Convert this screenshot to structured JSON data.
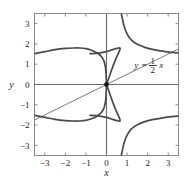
{
  "chart_data": {
    "type": "line",
    "title": "",
    "xlabel": "x",
    "ylabel": "y",
    "xlim": [
      -3.5,
      3.5
    ],
    "ylim": [
      -3.5,
      3.5
    ],
    "xticks": [
      -3,
      -2,
      -1,
      0,
      1,
      2,
      3
    ],
    "yticks": [
      -3,
      -2,
      -1,
      0,
      1,
      2,
      3
    ],
    "xtick_labels": [
      "−3",
      "−2",
      "−1",
      "0",
      "1",
      "2",
      "3"
    ],
    "ytick_labels": [
      "−3",
      "−2",
      "−1",
      "0",
      "1",
      "2",
      "3"
    ],
    "grid": false,
    "legend": "none",
    "annotations": [
      {
        "name": "line-equation-label",
        "text_y": "y",
        "text_eq": "=",
        "numerator": "1",
        "denominator": "2",
        "text_x": "x",
        "full_text": "y = 1/2 x",
        "x": 1.45,
        "y": 0.95
      }
    ],
    "markers": [
      {
        "name": "node-point",
        "x": 0,
        "y": 0,
        "style": "filled-dot",
        "color": "#1a1a1a"
      }
    ],
    "series": [
      {
        "name": "line-y-equals-half-x",
        "style": "thin-solid",
        "color": "#6b6b6b",
        "equation": "y = x/2",
        "points": [
          [
            -3.5,
            -1.75
          ],
          [
            3.5,
            1.75
          ]
        ]
      },
      {
        "name": "curve-upper-left-branch",
        "style": "thick-solid",
        "color": "#4a4a4a",
        "points": [
          [
            -3.5,
            1.52
          ],
          [
            -3.0,
            1.62
          ],
          [
            -2.5,
            1.72
          ],
          [
            -2.0,
            1.78
          ],
          [
            -1.6,
            1.8
          ],
          [
            -1.3,
            1.8
          ],
          [
            -1.0,
            1.77
          ],
          [
            -0.7,
            1.68
          ],
          [
            -0.45,
            1.55
          ],
          [
            -0.25,
            1.38
          ],
          [
            -0.12,
            1.15
          ],
          [
            -0.05,
            0.85
          ],
          [
            -0.02,
            0.5
          ],
          [
            0.0,
            0.0
          ]
        ]
      },
      {
        "name": "curve-loop-upper-right",
        "style": "thick-solid",
        "color": "#4a4a4a",
        "points": [
          [
            0.0,
            0.0
          ],
          [
            0.18,
            0.52
          ],
          [
            0.32,
            0.92
          ],
          [
            0.45,
            1.25
          ],
          [
            0.56,
            1.5
          ],
          [
            0.63,
            1.66
          ],
          [
            0.66,
            1.76
          ],
          [
            0.655,
            1.8
          ],
          [
            0.6,
            1.8
          ],
          [
            0.5,
            1.78
          ],
          [
            0.3,
            1.72
          ],
          [
            0.0,
            1.62
          ],
          [
            -0.4,
            1.55
          ],
          [
            -0.8,
            1.52
          ]
        ]
      },
      {
        "name": "curve-upper-right-asymptotic",
        "style": "thick-solid",
        "color": "#4a4a4a",
        "points": [
          [
            0.72,
            3.5
          ],
          [
            0.85,
            2.9
          ],
          [
            1.0,
            2.5
          ],
          [
            1.2,
            2.2
          ],
          [
            1.5,
            1.98
          ],
          [
            1.9,
            1.82
          ],
          [
            2.3,
            1.72
          ],
          [
            2.8,
            1.63
          ],
          [
            3.2,
            1.58
          ],
          [
            3.5,
            1.55
          ]
        ]
      },
      {
        "name": "curve-lower-left-branch",
        "style": "thick-solid",
        "color": "#4a4a4a",
        "points": [
          [
            -3.5,
            -1.52
          ],
          [
            -3.0,
            -1.62
          ],
          [
            -2.5,
            -1.72
          ],
          [
            -2.0,
            -1.78
          ],
          [
            -1.6,
            -1.8
          ],
          [
            -1.3,
            -1.8
          ],
          [
            -1.0,
            -1.77
          ],
          [
            -0.7,
            -1.68
          ],
          [
            -0.45,
            -1.55
          ],
          [
            -0.25,
            -1.38
          ],
          [
            -0.12,
            -1.15
          ],
          [
            -0.05,
            -0.85
          ],
          [
            -0.02,
            -0.5
          ],
          [
            0.0,
            0.0
          ]
        ]
      },
      {
        "name": "curve-loop-lower-right",
        "style": "thick-solid",
        "color": "#4a4a4a",
        "points": [
          [
            0.0,
            0.0
          ],
          [
            0.18,
            -0.52
          ],
          [
            0.32,
            -0.92
          ],
          [
            0.45,
            -1.25
          ],
          [
            0.56,
            -1.5
          ],
          [
            0.63,
            -1.66
          ],
          [
            0.66,
            -1.76
          ],
          [
            0.655,
            -1.8
          ],
          [
            0.6,
            -1.8
          ],
          [
            0.5,
            -1.78
          ],
          [
            0.3,
            -1.72
          ],
          [
            0.0,
            -1.62
          ],
          [
            -0.4,
            -1.55
          ],
          [
            -0.8,
            -1.52
          ]
        ]
      },
      {
        "name": "curve-lower-right-asymptotic",
        "style": "thick-solid",
        "color": "#4a4a4a",
        "points": [
          [
            0.72,
            -3.5
          ],
          [
            0.85,
            -2.9
          ],
          [
            1.0,
            -2.5
          ],
          [
            1.2,
            -2.2
          ],
          [
            1.5,
            -1.98
          ],
          [
            1.9,
            -1.82
          ],
          [
            2.3,
            -1.72
          ],
          [
            2.8,
            -1.63
          ],
          [
            3.2,
            -1.58
          ],
          [
            3.5,
            -1.55
          ]
        ]
      }
    ]
  },
  "axes": {
    "x_axis_label": "x",
    "y_axis_label": "y",
    "frame_color": "#8a8a8a",
    "axis_line_color": "#6b6b6b"
  }
}
